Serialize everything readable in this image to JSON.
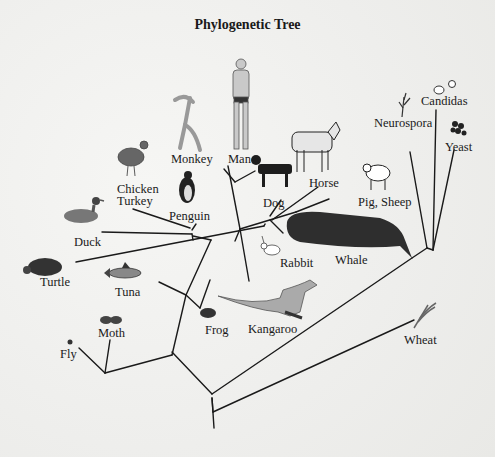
{
  "title": "Phylogenetic Tree",
  "colors": {
    "background": "#f2f2f0",
    "line": "#1a1a1a",
    "text": "#1a1a1a"
  },
  "taxa": {
    "candidas": "Candidas",
    "neurospora": "Neurospora",
    "yeast": "Yeast",
    "monkey": "Monkey",
    "man": "Man",
    "chicken": "Chicken",
    "turkey": "Turkey",
    "horse": "Horse",
    "pig_sheep": "Pig, Sheep",
    "penguin": "Penguin",
    "dog": "Dog",
    "duck": "Duck",
    "rabbit": "Rabbit",
    "whale": "Whale",
    "turtle": "Turtle",
    "tuna": "Tuna",
    "frog": "Frog",
    "kangaroo": "Kangaroo",
    "moth": "Moth",
    "fly": "Fly",
    "wheat": "Wheat"
  }
}
